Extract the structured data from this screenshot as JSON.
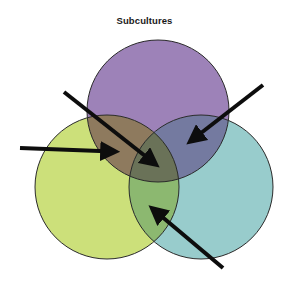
{
  "title": "Subcultures",
  "colors": {
    "purple": "#9d82b8",
    "lime": "#cce07a",
    "teal": "#98cccc",
    "purple_lime": "#8e7a5e",
    "purple_teal": "#747aa0",
    "lime_teal": "#8cb870",
    "center": "#6a7258",
    "outline": "#2a2a2a",
    "arrow": "#0d0d0d"
  },
  "circles": [
    {
      "id": "top",
      "color_key": "purple",
      "cx": 158,
      "cy": 111,
      "r": 71
    },
    {
      "id": "left",
      "color_key": "lime",
      "cx": 107,
      "cy": 187,
      "r": 72
    },
    {
      "id": "right",
      "color_key": "teal",
      "cx": 201,
      "cy": 187,
      "r": 72
    }
  ],
  "arrows": [
    {
      "id": "arrow-center",
      "points_to": "center-overlap",
      "x1": 64,
      "y1": 92,
      "x2": 156,
      "y2": 165
    },
    {
      "id": "arrow-purple-lime",
      "points_to": "top-left-overlap",
      "x1": 20,
      "y1": 148,
      "x2": 116,
      "y2": 152
    },
    {
      "id": "arrow-purple-teal",
      "points_to": "top-right-overlap",
      "x1": 263,
      "y1": 85,
      "x2": 190,
      "y2": 142
    },
    {
      "id": "arrow-lime-teal",
      "points_to": "bottom-overlap",
      "x1": 223,
      "y1": 268,
      "x2": 152,
      "y2": 208
    }
  ]
}
